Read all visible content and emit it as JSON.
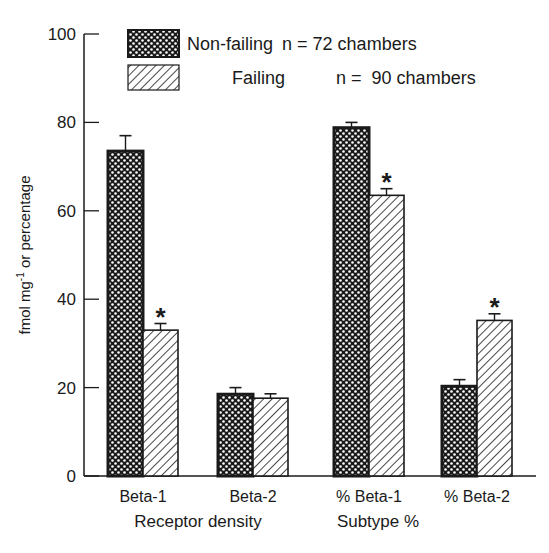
{
  "chart_data": {
    "type": "bar",
    "title": "",
    "xlabel": "",
    "ylabel": "fmol mg-1 or percentage",
    "ylabel_parts": {
      "pre": "fmol mg",
      "sup": "-1",
      "post": " or percentage"
    },
    "ylim": [
      0,
      100
    ],
    "yticks": [
      0,
      20,
      40,
      60,
      80,
      100
    ],
    "grid": false,
    "legend_position": "top-left",
    "categories": [
      "Beta-1",
      "Beta-2",
      "% Beta-1",
      "% Beta-2"
    ],
    "groups": [
      {
        "label": "Receptor density",
        "categories": [
          "Beta-1",
          "Beta-2"
        ]
      },
      {
        "label": "Subtype %",
        "categories": [
          "% Beta-1",
          "% Beta-2"
        ]
      }
    ],
    "series": [
      {
        "name": "Non-failing",
        "legend_label": "Non-failing",
        "n_label": "n = 72 chambers",
        "pattern": "crosshatch",
        "values": [
          73.5,
          18.5,
          78.8,
          20.3
        ],
        "errors": [
          3.5,
          1.5,
          1.2,
          1.5
        ]
      },
      {
        "name": "Failing",
        "legend_label": "Failing",
        "n_label": "n =  90 chambers",
        "pattern": "diagonal",
        "values": [
          33.0,
          17.6,
          63.5,
          35.2
        ],
        "errors": [
          1.5,
          1.0,
          1.5,
          1.5
        ]
      }
    ],
    "significance": [
      {
        "category": "Beta-1",
        "series": "Failing",
        "marker": "*"
      },
      {
        "category": "% Beta-1",
        "series": "Failing",
        "marker": "*"
      },
      {
        "category": "% Beta-2",
        "series": "Failing",
        "marker": "*"
      }
    ]
  }
}
